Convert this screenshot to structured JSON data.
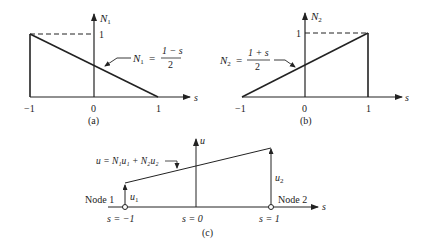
{
  "panel_a": {
    "caption": "(a)",
    "y_axis_label": "N",
    "y_axis_sub": "1",
    "x_axis_label": "s",
    "tick_labels": [
      "−1",
      "0",
      "1"
    ],
    "y_tick_label": "1",
    "formula_lhs": "N",
    "formula_sub": "1",
    "formula_eq": "=",
    "formula_num": "1 − s",
    "formula_den": "2"
  },
  "panel_b": {
    "caption": "(b)",
    "y_axis_label": "N",
    "y_axis_sub": "2",
    "x_axis_label": "s",
    "tick_labels": [
      "−1",
      "0",
      "1"
    ],
    "y_tick_label": "1",
    "formula_lhs": "N",
    "formula_sub": "2",
    "formula_eq": "=",
    "formula_num": "1 + s",
    "formula_den": "2"
  },
  "panel_c": {
    "caption": "(c)",
    "y_axis_label": "u",
    "x_axis_label": "s",
    "equation": "u = N₁u₁ + N₂u₂",
    "u1_label": "u",
    "u1_sub": "1",
    "u2_label": "u",
    "u2_sub": "2",
    "node1_label": "Node 1",
    "node2_label": "Node 2",
    "s_labels": [
      "s = −1",
      "s = 0",
      "s = 1"
    ]
  }
}
